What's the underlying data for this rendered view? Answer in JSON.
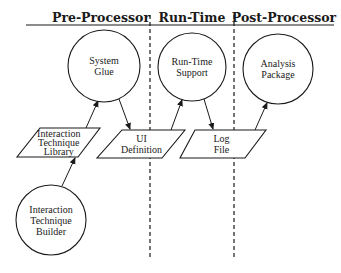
{
  "diagram": {
    "stages": [
      {
        "label": "Pre-Processor",
        "x": 101
      },
      {
        "label": "Run-Time",
        "x": 192
      },
      {
        "label": "Post-Processor",
        "x": 284
      }
    ],
    "header_rule": {
      "x1": 26,
      "x2": 334,
      "y": 25
    },
    "dividers": [
      {
        "x": 150,
        "y1": 15,
        "y2": 258
      },
      {
        "x": 234,
        "y1": 15,
        "y2": 258
      }
    ],
    "processes": [
      {
        "id": "system-glue",
        "lines": [
          "System",
          "Glue"
        ],
        "cx": 104,
        "cy": 66,
        "r": 36
      },
      {
        "id": "run-time-support",
        "lines": [
          "Run-Time",
          "Support"
        ],
        "cx": 192,
        "cy": 67,
        "r": 34
      },
      {
        "id": "analysis-package",
        "lines": [
          "Analysis",
          "Package"
        ],
        "cx": 278,
        "cy": 69,
        "r": 35
      },
      {
        "id": "interaction-technique-builder",
        "lines": [
          "Interaction",
          "Technique",
          "Builder"
        ],
        "cx": 51,
        "cy": 220,
        "r": 35
      }
    ],
    "data_stores": [
      {
        "id": "interaction-technique-library",
        "lines": [
          "Interaction",
          "Technique",
          "Library"
        ],
        "top": 128,
        "bottom": 157,
        "tl": 40,
        "tr": 100,
        "bl": 17,
        "br": 78
      },
      {
        "id": "ui-definition",
        "lines": [
          "UI",
          "Definition"
        ],
        "top": 130,
        "bottom": 158,
        "tl": 122,
        "tr": 185,
        "bl": 97,
        "br": 162
      },
      {
        "id": "log-file",
        "lines": [
          "Log",
          "File"
        ],
        "top": 130,
        "bottom": 158,
        "tl": 195,
        "tr": 266,
        "bl": 180,
        "br": 245
      }
    ],
    "flows": [
      {
        "from": "interaction-technique-builder",
        "to": "interaction-technique-library",
        "x1": 62,
        "y1": 186,
        "x2": 75,
        "y2": 158
      },
      {
        "from": "interaction-technique-library",
        "to": "system-glue",
        "x1": 86,
        "y1": 128,
        "x2": 98,
        "y2": 101
      },
      {
        "from": "system-glue",
        "to": "ui-definition",
        "x1": 119,
        "y1": 99,
        "x2": 130,
        "y2": 129
      },
      {
        "from": "ui-definition",
        "to": "run-time-support",
        "x1": 171,
        "y1": 130,
        "x2": 182,
        "y2": 100
      },
      {
        "from": "run-time-support",
        "to": "log-file",
        "x1": 204,
        "y1": 99,
        "x2": 213,
        "y2": 129
      },
      {
        "from": "log-file",
        "to": "analysis-package",
        "x1": 255,
        "y1": 130,
        "x2": 267,
        "y2": 103
      }
    ]
  }
}
